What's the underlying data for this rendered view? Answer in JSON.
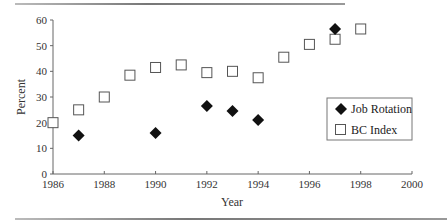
{
  "chart_data": {
    "type": "scatter",
    "title": "",
    "xlabel": "Year",
    "ylabel": "Percent",
    "xlim": [
      1986,
      2000
    ],
    "ylim": [
      0,
      60
    ],
    "xticks": [
      1986,
      1988,
      1990,
      1992,
      1994,
      1996,
      1998,
      2000
    ],
    "yticks": [
      0,
      10,
      20,
      30,
      40,
      50,
      60
    ],
    "grid": false,
    "legend_position": "inside-right",
    "series": [
      {
        "name": "Job Rotation",
        "marker": "filled-diamond",
        "color": "#111111",
        "x": [
          1987,
          1990,
          1992,
          1993,
          1994,
          1997
        ],
        "y": [
          15,
          16,
          26.5,
          24.5,
          21,
          56.5
        ]
      },
      {
        "name": "BC Index",
        "marker": "open-square",
        "color": "#555555",
        "x": [
          1986,
          1987,
          1988,
          1989,
          1990,
          1991,
          1992,
          1993,
          1994,
          1995,
          1996,
          1997,
          1998
        ],
        "y": [
          20,
          25,
          30,
          38.5,
          41.5,
          42.5,
          39.5,
          40,
          37.5,
          45.5,
          50.5,
          52.5,
          56.5
        ]
      }
    ]
  }
}
